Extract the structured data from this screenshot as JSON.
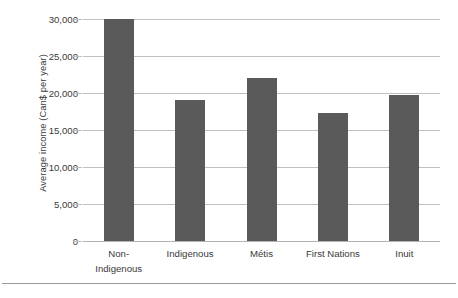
{
  "chart_data": {
    "type": "bar",
    "title": "",
    "xlabel": "",
    "ylabel": "Average income (Can$ per year)",
    "categories": [
      "Non-Indigenous",
      "Indigenous",
      "Métis",
      "First Nations",
      "Inuit"
    ],
    "category_lines": [
      [
        "Non-",
        "Indigenous"
      ],
      [
        "Indigenous"
      ],
      [
        "Métis"
      ],
      [
        "First Nations"
      ],
      [
        "Inuit"
      ]
    ],
    "values": [
      30000,
      19000,
      22000,
      17300,
      19700
    ],
    "ylim": [
      0,
      30000
    ],
    "ytick_values": [
      0,
      5000,
      10000,
      15000,
      20000,
      25000,
      30000
    ],
    "ytick_labels": [
      "0",
      "5,000",
      "10,000",
      "15,000",
      "20,000",
      "25,000",
      "30,000"
    ],
    "grid": true,
    "legend": false,
    "legend_position": "none",
    "bar_color": "#5a5a5a",
    "gridline_color": "#bfbfbf",
    "background_color": "#ffffff"
  }
}
